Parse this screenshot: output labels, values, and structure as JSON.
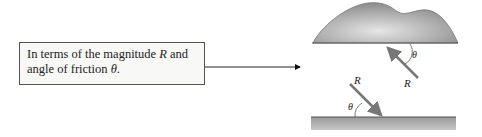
{
  "caption_box": {
    "line1_prefix": "In terms of the magnitude ",
    "line1_var": "R",
    "line1_suffix": " and",
    "line2_prefix": "angle of friction ",
    "line2_var": "θ",
    "line2_suffix": "."
  },
  "diagram": {
    "upper_force_label": "R",
    "upper_angle_label": "θ",
    "lower_force_label": "R",
    "lower_angle_label": "θ",
    "colors": {
      "body_fill": "#9a9a9a",
      "arrow": "#777777",
      "ground": "#b5b5b5",
      "box_border": "#555555"
    }
  }
}
